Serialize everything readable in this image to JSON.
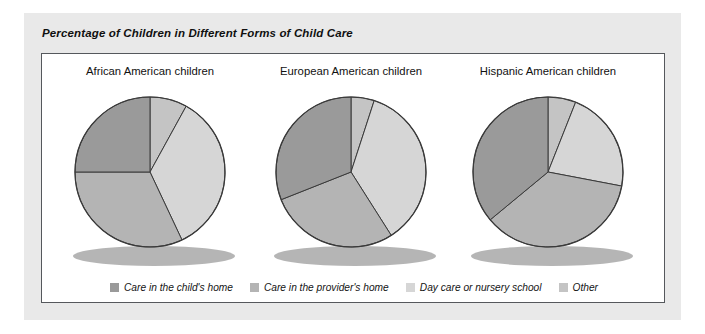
{
  "figure": {
    "title": "Percentage of Children in Different Forms of Child Care"
  },
  "colors": {
    "child_home": "#9a9a9a",
    "provider_home": "#b4b4b4",
    "day_care": "#d6d6d6",
    "other": "#c4c4c4",
    "slice_stroke": "#3a3a3a",
    "panel_bg": "#e9e9e9",
    "plot_bg": "#ffffff",
    "plot_border": "#55585c",
    "shadow": "#a8a8a8"
  },
  "legend": {
    "items": [
      {
        "label": "Care in the child's home",
        "color": "#9a9a9a"
      },
      {
        "label": "Care in the provider's home",
        "color": "#b4b4b4"
      },
      {
        "label": "Day care or nursery school",
        "color": "#d6d6d6"
      },
      {
        "label": "Other",
        "color": "#c4c4c4"
      }
    ]
  },
  "chart_data": {
    "type": "pie",
    "title": "Percentage of Children in Different Forms of Child Care",
    "legend_position": "bottom",
    "categories": [
      "Care in the child's home",
      "Care in the provider's home",
      "Day care or nursery school",
      "Other"
    ],
    "units": "percent",
    "charts": [
      {
        "title": "African American children",
        "labels": [
          "Care in the child's home",
          "Care in the provider's home",
          "Day care or nursery school",
          "Other"
        ],
        "values": [
          25,
          32,
          35,
          8
        ]
      },
      {
        "title": "European American children",
        "labels": [
          "Care in the child's home",
          "Care in the provider's home",
          "Day care or nursery school",
          "Other"
        ],
        "values": [
          31,
          28,
          36,
          5
        ]
      },
      {
        "title": "Hispanic American children",
        "labels": [
          "Care in the child's home",
          "Care in the provider's home",
          "Day care or nursery school",
          "Other"
        ],
        "values": [
          36,
          36,
          22,
          6
        ]
      }
    ]
  }
}
